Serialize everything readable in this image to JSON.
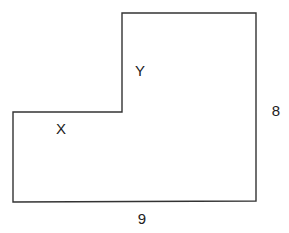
{
  "diagram": {
    "type": "l-shaped-polygon",
    "outline_color": "#333333",
    "background_color": "#ffffff",
    "vertices": [
      [
        122,
        13
      ],
      [
        256,
        13
      ],
      [
        256,
        201
      ],
      [
        13,
        202
      ],
      [
        13,
        112
      ],
      [
        122,
        112
      ]
    ],
    "labels": {
      "region_x": "X",
      "region_y": "Y",
      "height_dimension": "8",
      "width_dimension": "9"
    }
  }
}
